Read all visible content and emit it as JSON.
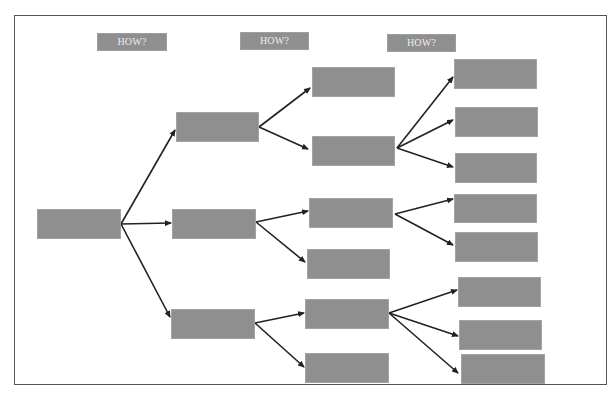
{
  "diagram": {
    "type": "tree",
    "direction": "left-to-right",
    "frame": {
      "x": 14,
      "y": 15,
      "w": 593,
      "h": 370
    },
    "colors": {
      "box_fill": "#8f8f8f",
      "box_border": "#a3a3a3",
      "label_text": "#ececec",
      "edge": "#222222",
      "frame_border": "#555555",
      "background": "#ffffff"
    },
    "column_headers": [
      {
        "id": "how1",
        "label": "HOW?",
        "x": 97,
        "y": 33,
        "w": 70,
        "h": 18
      },
      {
        "id": "how2",
        "label": "HOW?",
        "x": 240,
        "y": 32,
        "w": 69,
        "h": 18
      },
      {
        "id": "how3",
        "label": "HOW?",
        "x": 387,
        "y": 34,
        "w": 69,
        "h": 18
      }
    ],
    "nodes": [
      {
        "id": "root",
        "level": 0,
        "label": "",
        "x": 37,
        "y": 209,
        "w": 84,
        "h": 30
      },
      {
        "id": "a",
        "level": 1,
        "label": "",
        "x": 176,
        "y": 112,
        "w": 83,
        "h": 30
      },
      {
        "id": "b",
        "level": 1,
        "label": "",
        "x": 172,
        "y": 209,
        "w": 84,
        "h": 30
      },
      {
        "id": "c",
        "level": 1,
        "label": "",
        "x": 171,
        "y": 309,
        "w": 84,
        "h": 30
      },
      {
        "id": "a1",
        "level": 2,
        "label": "",
        "x": 312,
        "y": 67,
        "w": 83,
        "h": 30
      },
      {
        "id": "a2",
        "level": 2,
        "label": "",
        "x": 312,
        "y": 136,
        "w": 83,
        "h": 30
      },
      {
        "id": "b1",
        "level": 2,
        "label": "",
        "x": 309,
        "y": 198,
        "w": 84,
        "h": 30
      },
      {
        "id": "b2",
        "level": 2,
        "label": "",
        "x": 307,
        "y": 249,
        "w": 83,
        "h": 30
      },
      {
        "id": "c1",
        "level": 2,
        "label": "",
        "x": 305,
        "y": 299,
        "w": 84,
        "h": 30
      },
      {
        "id": "c2",
        "level": 2,
        "label": "",
        "x": 305,
        "y": 353,
        "w": 84,
        "h": 30
      },
      {
        "id": "a2x",
        "level": 3,
        "label": "",
        "x": 454,
        "y": 59,
        "w": 83,
        "h": 30
      },
      {
        "id": "a2y",
        "level": 3,
        "label": "",
        "x": 455,
        "y": 107,
        "w": 83,
        "h": 30
      },
      {
        "id": "a2z",
        "level": 3,
        "label": "",
        "x": 455,
        "y": 153,
        "w": 82,
        "h": 30
      },
      {
        "id": "b1x",
        "level": 3,
        "label": "",
        "x": 454,
        "y": 194,
        "w": 83,
        "h": 29
      },
      {
        "id": "b1y",
        "level": 3,
        "label": "",
        "x": 455,
        "y": 232,
        "w": 83,
        "h": 30
      },
      {
        "id": "c1x",
        "level": 3,
        "label": "",
        "x": 458,
        "y": 277,
        "w": 83,
        "h": 30
      },
      {
        "id": "c1y",
        "level": 3,
        "label": "",
        "x": 459,
        "y": 320,
        "w": 83,
        "h": 30
      },
      {
        "id": "c1z",
        "level": 3,
        "label": "",
        "x": 461,
        "y": 354,
        "w": 84,
        "h": 30
      }
    ],
    "edges": [
      {
        "from": "root",
        "to": "a",
        "x1": 121,
        "y1": 224,
        "x2": 175,
        "y2": 130
      },
      {
        "from": "root",
        "to": "b",
        "x1": 121,
        "y1": 224,
        "x2": 171,
        "y2": 223
      },
      {
        "from": "root",
        "to": "c",
        "x1": 121,
        "y1": 224,
        "x2": 170,
        "y2": 317
      },
      {
        "from": "a",
        "to": "a1",
        "x1": 259,
        "y1": 127,
        "x2": 310,
        "y2": 88
      },
      {
        "from": "a",
        "to": "a2",
        "x1": 259,
        "y1": 127,
        "x2": 308,
        "y2": 149
      },
      {
        "from": "b",
        "to": "b1",
        "x1": 256,
        "y1": 222,
        "x2": 308,
        "y2": 211
      },
      {
        "from": "b",
        "to": "b2",
        "x1": 256,
        "y1": 222,
        "x2": 305,
        "y2": 262
      },
      {
        "from": "c",
        "to": "c1",
        "x1": 255,
        "y1": 323,
        "x2": 304,
        "y2": 313
      },
      {
        "from": "c",
        "to": "c2",
        "x1": 255,
        "y1": 323,
        "x2": 304,
        "y2": 367
      },
      {
        "from": "a2",
        "to": "a2x",
        "x1": 397,
        "y1": 148,
        "x2": 453,
        "y2": 77
      },
      {
        "from": "a2",
        "to": "a2y",
        "x1": 397,
        "y1": 148,
        "x2": 453,
        "y2": 120
      },
      {
        "from": "a2",
        "to": "a2z",
        "x1": 397,
        "y1": 148,
        "x2": 453,
        "y2": 167
      },
      {
        "from": "b1",
        "to": "b1x",
        "x1": 395,
        "y1": 214,
        "x2": 453,
        "y2": 199
      },
      {
        "from": "b1",
        "to": "b1y",
        "x1": 395,
        "y1": 214,
        "x2": 453,
        "y2": 245
      },
      {
        "from": "c1",
        "to": "c1x",
        "x1": 389,
        "y1": 313,
        "x2": 457,
        "y2": 290
      },
      {
        "from": "c1",
        "to": "c1y",
        "x1": 389,
        "y1": 313,
        "x2": 458,
        "y2": 336
      },
      {
        "from": "c1",
        "to": "c1z",
        "x1": 389,
        "y1": 313,
        "x2": 458,
        "y2": 373
      }
    ]
  }
}
